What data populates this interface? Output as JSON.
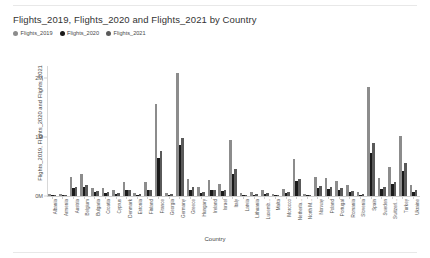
{
  "chart": {
    "title": "Flights_2019, Flights_2020 and Flights_2021 by Country",
    "xaxis_title": "Country",
    "yaxis_title": "Flights_2019, Flights_2020 and Flights_2021"
  },
  "legend": {
    "position": "top-left",
    "items": [
      {
        "label": "Flights_2019",
        "color": "#8c8c8c"
      },
      {
        "label": "Flights_2020",
        "color": "#1a1a1a"
      },
      {
        "label": "Flights_2021",
        "color": "#5a5a5a"
      }
    ]
  },
  "yticks": [
    {
      "label": "2M",
      "value": 2000000
    },
    {
      "label": "1M",
      "value": 1000000
    },
    {
      "label": "0M",
      "value": 0
    }
  ],
  "chart_data": {
    "type": "bar",
    "title": "Flights_2019, Flights_2020 and Flights_2021 by Country",
    "xlabel": "Country",
    "ylabel": "Flights_2019, Flights_2020 and Flights_2021",
    "ylim": [
      0,
      2200000
    ],
    "grid": false,
    "legend_position": "top-left",
    "categories": [
      "Albania",
      "Armenia",
      "Austria",
      "Belgium",
      "Bulgaria",
      "Croatia",
      "Cyprus",
      "Denmark",
      "Estonia",
      "Finland",
      "France",
      "Georgia",
      "Germany",
      "Greece",
      "Hungary",
      "Ireland",
      "Israel",
      "Italy",
      "Latvia",
      "Lithuania",
      "Luxemb...",
      "Malta",
      "Morocco",
      "Netherla...",
      "North M...",
      "Norway",
      "Poland",
      "Portugal",
      "Romania",
      "Slovenia",
      "Spain",
      "Sweden",
      "Switzerl...",
      "Turkey",
      "Ukraine"
    ],
    "series": [
      {
        "name": "Flights_2019",
        "color": "#8c8c8c",
        "values": [
          33000,
          26000,
          320000,
          380000,
          140000,
          130000,
          95000,
          230000,
          55000,
          230000,
          1560000,
          55000,
          2090000,
          290000,
          150000,
          270000,
          210000,
          950000,
          48000,
          62000,
          95000,
          42000,
          120000,
          620000,
          40000,
          330000,
          310000,
          260000,
          180000,
          60000,
          1840000,
          300000,
          490000,
          1010000,
          180000
        ]
      },
      {
        "name": "Flights_2020",
        "color": "#1a1a1a",
        "values": [
          14000,
          9000,
          130000,
          160000,
          60000,
          52000,
          35000,
          95000,
          23000,
          95000,
          640000,
          22000,
          860000,
          110000,
          58000,
          100000,
          78000,
          380000,
          20000,
          25000,
          40000,
          17000,
          48000,
          250000,
          16000,
          140000,
          125000,
          100000,
          72000,
          25000,
          720000,
          125000,
          200000,
          420000,
          75000
        ]
      },
      {
        "name": "Flights_2021",
        "color": "#5a5a5a",
        "values": [
          20000,
          13000,
          150000,
          185000,
          78000,
          72000,
          52000,
          110000,
          27000,
          105000,
          760000,
          30000,
          980000,
          150000,
          72000,
          110000,
          95000,
          460000,
          24000,
          31000,
          52000,
          23000,
          60000,
          290000,
          19000,
          165000,
          155000,
          135000,
          92000,
          32000,
          900000,
          145000,
          235000,
          560000,
          95000
        ]
      }
    ]
  }
}
